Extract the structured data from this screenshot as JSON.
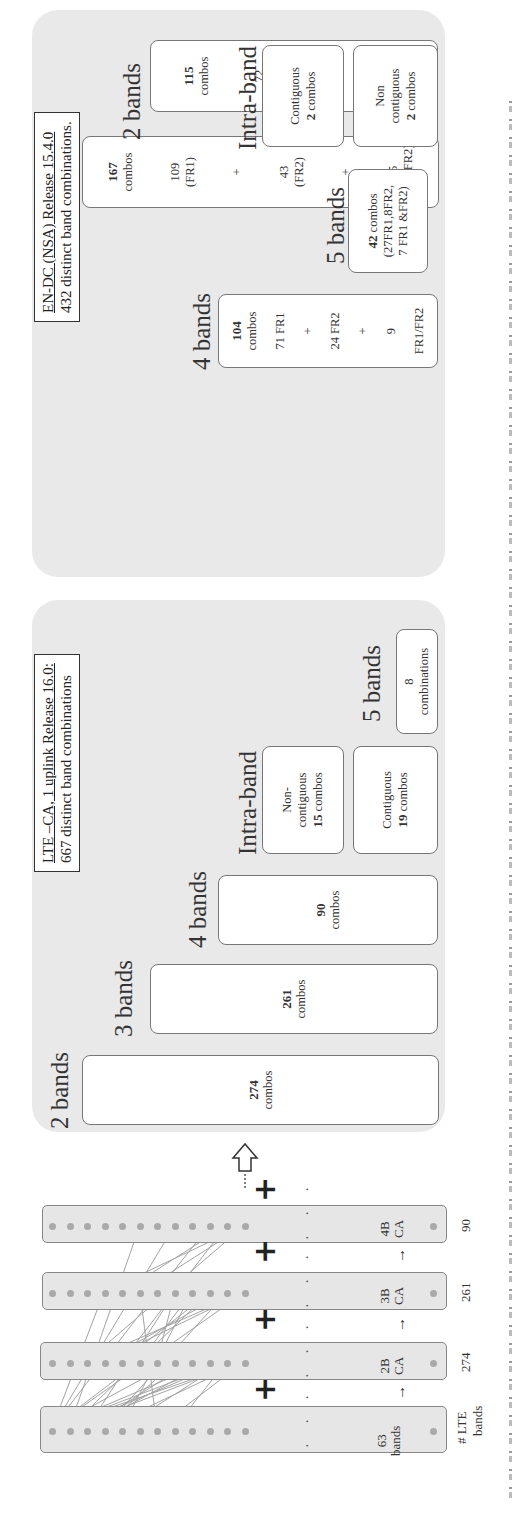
{
  "left_diagram": {
    "strips": [
      {
        "id": "lte",
        "count_label": "63",
        "count_sublabel": "bands",
        "axis_label": "# LTE",
        "axis_sublabel": "bands"
      },
      {
        "id": "2b",
        "count_label": "2B",
        "count_sublabel": "CA",
        "total": "274"
      },
      {
        "id": "3b",
        "count_label": "3B",
        "count_sublabel": "CA",
        "total": "261"
      },
      {
        "id": "4b",
        "count_label": "4B",
        "count_sublabel": "CA",
        "total": "90"
      }
    ],
    "ellipsis": "· · ·",
    "plus_symbol": "+",
    "continuation": "⋮",
    "arrow_small": "→"
  },
  "lte_panel": {
    "title_line1": "LTE –CA, 1 uplink Release 16.0:",
    "title_line2": "667 distinct band combinations",
    "groups": [
      {
        "heading": "2 bands",
        "count": "274",
        "unit": "combos"
      },
      {
        "heading": "3 bands",
        "count": "261",
        "unit": "combos"
      },
      {
        "heading": "4 bands",
        "count": "90",
        "unit": "combos"
      },
      {
        "heading": "5 bands",
        "count": "8",
        "unit": "combinations"
      }
    ],
    "intra_band": {
      "heading": "Intra-band",
      "contiguous": {
        "label": "Contiguous",
        "count": "19",
        "unit": "combos"
      },
      "non_contiguous": {
        "label1": "Non-",
        "label2": "contiguous",
        "count": "15",
        "unit": "combos"
      }
    }
  },
  "nsa_panel": {
    "title_line1": "EN-DC (NSA) Release 15.4.0",
    "title_line2": "432 distinct band combinations.",
    "groups": [
      {
        "heading": "3 bands",
        "count": "167",
        "unit": "combos",
        "breakdown": [
          "109",
          "(FR1)",
          "+",
          "43",
          "(FR2)",
          "+",
          "15",
          "(FR1/FR2)"
        ]
      },
      {
        "heading": "2 bands",
        "count": "115",
        "unit": "combos",
        "breakdown": [
          "72",
          "(FR1)",
          "+",
          "43",
          "(FR2)"
        ]
      },
      {
        "heading": "4 bands",
        "count": "104",
        "unit": "combos",
        "breakdown": [
          "71 FR1",
          "+",
          "24 FR2",
          "+",
          "9",
          "FR1/FR2"
        ]
      },
      {
        "heading": "5 bands",
        "count": "42",
        "unit": "combos",
        "breakdown": [
          "(27FR1,8FR2,",
          "7 FR1 &FR2)"
        ]
      }
    ],
    "intra_band": {
      "heading": "Intra-band",
      "contiguous": {
        "label": "Contiguous",
        "count": "2",
        "unit": "combos"
      },
      "non_contiguous": {
        "label1": "Non",
        "label2": "contiguous",
        "count": "2",
        "unit": "combos"
      }
    }
  },
  "colors": {
    "panel_bg": "#e9e9e9",
    "box_bg": "#ffffff",
    "dot": "#a9a9a9",
    "line": "#9a9a9a"
  }
}
